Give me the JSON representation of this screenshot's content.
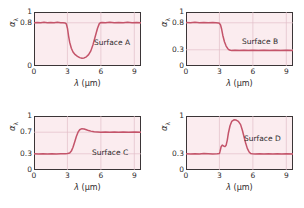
{
  "figure": {
    "background": "#ffffff",
    "curve_color": "#c4546a",
    "plot_background": "#fbecef",
    "axis_color": "#3b3537",
    "grid_color": "#e3bfc8"
  },
  "axis": {
    "xlabel_symbol": "λ",
    "xlabel_units": "(μm)",
    "ylabel_symbol": "α",
    "ylabel_subscript": "λ",
    "xticks": [
      "0",
      "3",
      "6",
      "9"
    ],
    "xlim": [
      0,
      9.6
    ]
  },
  "chart_data": [
    {
      "type": "line",
      "name": "Surface A",
      "label": "Surface A",
      "xlabel": "λ (μm)",
      "ylabel": "αλ",
      "xlim": [
        0,
        9.6
      ],
      "ylim": [
        0,
        1
      ],
      "xticks": [
        0,
        3,
        6,
        9
      ],
      "yticks": [
        0,
        0.8,
        1
      ],
      "ytick_labels": [
        "0",
        "0.8",
        "1"
      ],
      "grid": true,
      "x": [
        0.0,
        0.3,
        0.6,
        0.9,
        1.2,
        1.5,
        1.8,
        2.1,
        2.4,
        2.6,
        2.8,
        2.9,
        3.0,
        3.1,
        3.2,
        3.35,
        3.5,
        3.7,
        3.9,
        4.1,
        4.3,
        4.5,
        4.7,
        4.9,
        5.1,
        5.3,
        5.5,
        5.7,
        5.85,
        5.95,
        6.1,
        6.4,
        6.8,
        7.2,
        7.6,
        8.0,
        8.4,
        8.8,
        9.2,
        9.6
      ],
      "y": [
        0.8,
        0.805,
        0.8,
        0.81,
        0.8,
        0.805,
        0.8,
        0.81,
        0.8,
        0.8,
        0.795,
        0.78,
        0.7,
        0.56,
        0.44,
        0.33,
        0.26,
        0.21,
        0.18,
        0.155,
        0.145,
        0.15,
        0.17,
        0.21,
        0.28,
        0.4,
        0.55,
        0.7,
        0.78,
        0.8,
        0.805,
        0.8,
        0.81,
        0.8,
        0.805,
        0.8,
        0.81,
        0.8,
        0.805,
        0.8
      ]
    },
    {
      "type": "line",
      "name": "Surface B",
      "label": "Surface B",
      "xlabel": "λ (μm)",
      "ylabel": "αλ",
      "xlim": [
        0,
        9.6
      ],
      "ylim": [
        0,
        1
      ],
      "xticks": [
        0,
        3,
        6,
        9
      ],
      "yticks": [
        0,
        0.3,
        0.8,
        1
      ],
      "ytick_labels": [
        "0",
        "0.3",
        "0.8",
        "1"
      ],
      "grid": true,
      "x": [
        0.0,
        0.4,
        0.8,
        1.2,
        1.6,
        2.0,
        2.4,
        2.7,
        2.9,
        3.0,
        3.1,
        3.2,
        3.3,
        3.45,
        3.6,
        3.75,
        3.9,
        4.1,
        4.4,
        4.8,
        5.2,
        5.6,
        6.0,
        6.5,
        7.0,
        7.5,
        8.0,
        8.5,
        9.0,
        9.6
      ],
      "y": [
        0.805,
        0.8,
        0.81,
        0.8,
        0.805,
        0.8,
        0.805,
        0.8,
        0.795,
        0.79,
        0.76,
        0.68,
        0.57,
        0.45,
        0.37,
        0.32,
        0.295,
        0.285,
        0.29,
        0.285,
        0.29,
        0.285,
        0.29,
        0.285,
        0.29,
        0.285,
        0.29,
        0.285,
        0.29,
        0.285
      ]
    },
    {
      "type": "line",
      "name": "Surface C",
      "label": "Surface C",
      "xlabel": "λ (μm)",
      "ylabel": "αλ",
      "xlim": [
        0,
        9.6
      ],
      "ylim": [
        0,
        1
      ],
      "xticks": [
        0,
        3,
        6,
        9
      ],
      "yticks": [
        0,
        0.3,
        0.7,
        1
      ],
      "ytick_labels": [
        "0",
        "0.3",
        "0.7",
        "1"
      ],
      "grid": true,
      "x": [
        0.0,
        0.4,
        0.8,
        1.2,
        1.6,
        2.0,
        2.4,
        2.8,
        3.0,
        3.2,
        3.35,
        3.5,
        3.65,
        3.8,
        3.95,
        4.1,
        4.3,
        4.5,
        4.7,
        4.9,
        5.1,
        5.4,
        5.7,
        6.0,
        6.4,
        6.8,
        7.2,
        7.6,
        8.0,
        8.5,
        9.0,
        9.6
      ],
      "y": [
        0.3,
        0.295,
        0.3,
        0.295,
        0.3,
        0.295,
        0.3,
        0.3,
        0.305,
        0.315,
        0.35,
        0.42,
        0.52,
        0.62,
        0.7,
        0.745,
        0.765,
        0.76,
        0.745,
        0.73,
        0.72,
        0.71,
        0.705,
        0.7,
        0.705,
        0.7,
        0.705,
        0.7,
        0.705,
        0.7,
        0.705,
        0.7
      ]
    },
    {
      "type": "line",
      "name": "Surface D",
      "label": "Surface D",
      "xlabel": "λ (μm)",
      "ylabel": "αλ",
      "xlim": [
        0,
        9.6
      ],
      "ylim": [
        0,
        1
      ],
      "xticks": [
        0,
        3,
        6,
        9
      ],
      "yticks": [
        0,
        0.3,
        1
      ],
      "ytick_labels": [
        "0",
        "0.3",
        "1"
      ],
      "grid": true,
      "x": [
        0.0,
        0.4,
        0.8,
        1.2,
        1.6,
        2.0,
        2.4,
        2.8,
        3.0,
        3.05,
        3.15,
        3.25,
        3.4,
        3.5,
        3.6,
        3.7,
        3.8,
        3.95,
        4.1,
        4.3,
        4.5,
        4.7,
        4.9,
        5.05,
        5.2,
        5.35,
        5.5,
        5.65,
        5.8,
        5.95,
        6.2,
        6.6,
        7.0,
        7.4,
        7.8,
        8.2,
        8.6,
        9.0,
        9.6
      ],
      "y": [
        0.3,
        0.295,
        0.3,
        0.295,
        0.305,
        0.3,
        0.295,
        0.3,
        0.305,
        0.34,
        0.43,
        0.46,
        0.44,
        0.435,
        0.46,
        0.55,
        0.68,
        0.82,
        0.9,
        0.93,
        0.925,
        0.9,
        0.84,
        0.74,
        0.62,
        0.5,
        0.4,
        0.34,
        0.305,
        0.3,
        0.295,
        0.3,
        0.295,
        0.3,
        0.295,
        0.3,
        0.295,
        0.3,
        0.295
      ]
    }
  ],
  "panels": [
    {
      "id": "a",
      "label": "Surface A",
      "label_x": 60,
      "label_y": 27
    },
    {
      "id": "b",
      "label": "Surface B",
      "label_x": 56,
      "label_y": 26
    },
    {
      "id": "c",
      "label": "Surface C",
      "label_x": 58,
      "label_y": 33
    },
    {
      "id": "d",
      "label": "Surface D",
      "label_x": 58,
      "label_y": 19
    }
  ]
}
